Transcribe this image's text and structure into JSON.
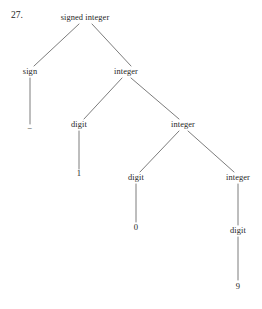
{
  "figure": {
    "item_number": "27.",
    "caption": "",
    "ink_color": "#242424",
    "background_color": "#ffffff"
  },
  "tree": {
    "type": "parse-tree",
    "derived_string": "-109",
    "nodes": [
      {
        "id": "n0",
        "label": "signed integer",
        "kind": "nonterminal",
        "x": 85,
        "y": 18,
        "depth": 0
      },
      {
        "id": "n1",
        "label": "sign",
        "kind": "nonterminal",
        "x": 30,
        "y": 72,
        "depth": 1
      },
      {
        "id": "n2",
        "label": "integer",
        "kind": "nonterminal",
        "x": 126,
        "y": 72,
        "depth": 1
      },
      {
        "id": "n3",
        "label": "−",
        "kind": "terminal",
        "x": 30,
        "y": 128,
        "depth": 2
      },
      {
        "id": "n4",
        "label": "digit",
        "kind": "nonterminal",
        "x": 79,
        "y": 125,
        "depth": 2
      },
      {
        "id": "n5",
        "label": "integer",
        "kind": "nonterminal",
        "x": 183,
        "y": 125,
        "depth": 2
      },
      {
        "id": "n6",
        "label": "1",
        "kind": "terminal",
        "x": 79,
        "y": 173,
        "depth": 3
      },
      {
        "id": "n7",
        "label": "digit",
        "kind": "nonterminal",
        "x": 136,
        "y": 178,
        "depth": 3
      },
      {
        "id": "n8",
        "label": "integer",
        "kind": "nonterminal",
        "x": 238,
        "y": 178,
        "depth": 3
      },
      {
        "id": "n9",
        "label": "0",
        "kind": "terminal",
        "x": 136,
        "y": 227,
        "depth": 4
      },
      {
        "id": "n10",
        "label": "digit",
        "kind": "nonterminal",
        "x": 238,
        "y": 231,
        "depth": 4
      },
      {
        "id": "n11",
        "label": "9",
        "kind": "terminal",
        "x": 238,
        "y": 286,
        "depth": 5
      }
    ],
    "edges": [
      {
        "from": "n0",
        "to": "n1",
        "x1": 79,
        "y1": 24,
        "x2": 34,
        "y2": 66
      },
      {
        "from": "n0",
        "to": "n2",
        "x1": 92,
        "y1": 24,
        "x2": 131,
        "y2": 66
      },
      {
        "from": "n1",
        "to": "n3",
        "x1": 30,
        "y1": 78,
        "x2": 30,
        "y2": 124
      },
      {
        "from": "n2",
        "to": "n4",
        "x1": 122,
        "y1": 78,
        "x2": 84,
        "y2": 119
      },
      {
        "from": "n2",
        "to": "n5",
        "x1": 131,
        "y1": 78,
        "x2": 179,
        "y2": 119
      },
      {
        "from": "n4",
        "to": "n6",
        "x1": 79,
        "y1": 131,
        "x2": 79,
        "y2": 169
      },
      {
        "from": "n5",
        "to": "n7",
        "x1": 179,
        "y1": 131,
        "x2": 140,
        "y2": 172
      },
      {
        "from": "n5",
        "to": "n8",
        "x1": 188,
        "y1": 131,
        "x2": 234,
        "y2": 172
      },
      {
        "from": "n7",
        "to": "n9",
        "x1": 136,
        "y1": 184,
        "x2": 136,
        "y2": 222
      },
      {
        "from": "n8",
        "to": "n10",
        "x1": 238,
        "y1": 184,
        "x2": 238,
        "y2": 225
      },
      {
        "from": "n10",
        "to": "n11",
        "x1": 238,
        "y1": 237,
        "x2": 238,
        "y2": 280
      }
    ],
    "stroke_color": "#5a5a5a",
    "stroke_width": 0.8
  }
}
